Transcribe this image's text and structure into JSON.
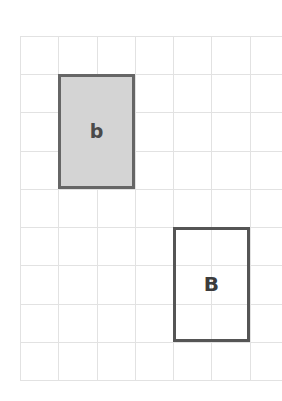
{
  "figure": {
    "title": "",
    "background_color": "#ffffff",
    "grid": {
      "name": "square-grid",
      "columns": 7,
      "rows": 9,
      "cell_size_px": 38.2,
      "line_color": "#e2e2e2",
      "origin_x_px": 20,
      "origin_y_px": 36,
      "width_px": 268,
      "height_px": 344
    },
    "shapes": [
      {
        "id": "rect-small-b",
        "label": "b",
        "label_case": "lowercase",
        "fill": "#d4d4d4",
        "stroke": "#666666",
        "stroke_width_px": 3,
        "grid_col_start": 1,
        "grid_col_span": 2,
        "grid_row_start": 1,
        "grid_row_span": 3,
        "width_cells": 2,
        "height_cells": 3
      },
      {
        "id": "rect-large-B",
        "label": "B",
        "label_case": "uppercase",
        "fill": "none",
        "stroke": "#555555",
        "stroke_width_px": 3,
        "grid_col_start": 4,
        "grid_col_span": 2,
        "grid_row_start": 5,
        "grid_row_span": 3,
        "width_cells": 2,
        "height_cells": 3
      }
    ]
  }
}
